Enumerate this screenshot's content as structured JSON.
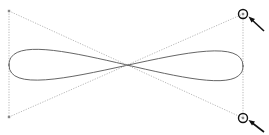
{
  "diagram": {
    "title": "",
    "colors": {
      "background": "#ffffff",
      "curve": "#555555",
      "guides": "#9a9a9a",
      "highlight": "#111111"
    },
    "anchor_points": [
      {
        "id": "left-anchor",
        "x": 9,
        "y": 65
      },
      {
        "id": "right-anchor",
        "x": 243,
        "y": 66
      }
    ],
    "control_points": [
      {
        "id": "top-left",
        "x": 9,
        "y": 11
      },
      {
        "id": "bottom-left",
        "x": 9,
        "y": 117
      },
      {
        "id": "top-right",
        "x": 243,
        "y": 14,
        "highlighted": true
      },
      {
        "id": "bottom-right",
        "x": 243,
        "y": 118,
        "highlighted": true
      }
    ],
    "crossing_point": {
      "x": 126,
      "y": 65
    },
    "annotations": [
      {
        "id": "arrow-top-right",
        "target": "top-right",
        "label": ""
      },
      {
        "id": "arrow-bottom-right",
        "target": "bottom-right",
        "label": ""
      }
    ]
  }
}
